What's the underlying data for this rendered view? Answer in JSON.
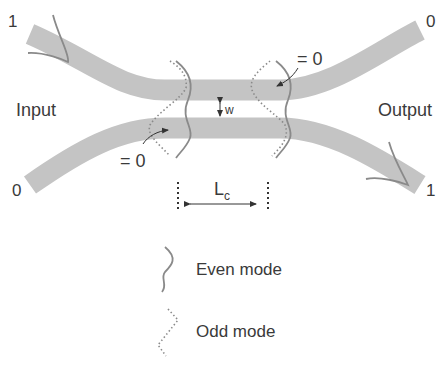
{
  "diagram": {
    "colors": {
      "waveguide": "#c4c4c4",
      "mode_line": "#8a8a8a",
      "text": "#3a3a3a",
      "arrow": "#333333"
    },
    "labels": {
      "input": "Input",
      "output": "Output",
      "input_top_port": "1",
      "input_bottom_port": "0",
      "output_top_port": "0",
      "output_bottom_port": "1",
      "eq_zero_top": "= 0",
      "eq_zero_bottom": "= 0",
      "gap": "w",
      "coupling_length_main": "L",
      "coupling_length_sub": "c"
    },
    "legend": [
      {
        "icon": "even-mode-solid-wave",
        "label": "Even mode"
      },
      {
        "icon": "odd-mode-dotted-wave",
        "label": "Odd mode"
      }
    ]
  }
}
